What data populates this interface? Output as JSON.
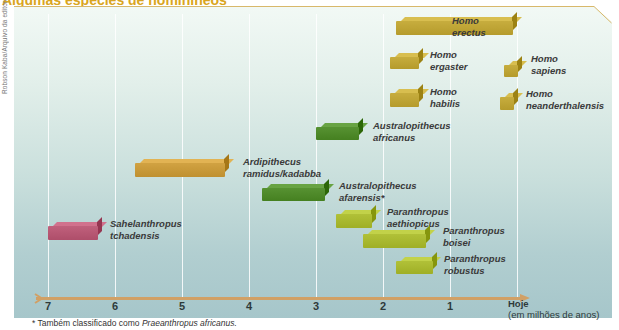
{
  "title": "Algumas espécies de hominíneos",
  "credit": "Robson Kaba/Arquivo da editora",
  "colors": {
    "homo": "#bfa536",
    "ardipithecus": "#c99a3a",
    "australopithecus": "#4f8a2a",
    "sahelanthropus": "#b85874",
    "paranthropus": "#a9b930",
    "axis": "#d1a065",
    "title": "#d9a520"
  },
  "axis": {
    "ticks": [
      "7",
      "6",
      "5",
      "4",
      "3",
      "2",
      "1"
    ],
    "end_label": "Hoje",
    "unit_label": "(em milhões de anos)"
  },
  "footnote": {
    "prefix": "* Também classificado como ",
    "italic": "Praeanthropus africanus."
  },
  "chart_data": {
    "type": "bar",
    "orientation": "horizontal-timeline",
    "title": "Algumas espécies de hominíneos",
    "xlabel": "Hoje (em milhões de anos)",
    "xlim": [
      7,
      0
    ],
    "x_ticks": [
      7,
      6,
      5,
      4,
      3,
      2,
      1,
      0
    ],
    "grid": true,
    "series": [
      {
        "name": "Homo erectus",
        "start_ma": 1.8,
        "end_ma": 0.0,
        "group": "Homo",
        "label_line1": "Homo",
        "label_line2": "erectus"
      },
      {
        "name": "Homo ergaster",
        "start_ma": 1.9,
        "end_ma": 1.4,
        "group": "Homo",
        "label_line1": "Homo",
        "label_line2": "ergaster"
      },
      {
        "name": "Homo sapiens",
        "start_ma": 0.2,
        "end_ma": 0.0,
        "group": "Homo",
        "label_line1": "Homo",
        "label_line2": "sapiens"
      },
      {
        "name": "Homo habilis",
        "start_ma": 1.9,
        "end_ma": 1.4,
        "group": "Homo",
        "label_line1": "Homo",
        "label_line2": "habilis"
      },
      {
        "name": "Homo neanderthalensis",
        "start_ma": 0.25,
        "end_ma": 0.03,
        "group": "Homo",
        "label_line1": "Homo",
        "label_line2": "neanderthalensis"
      },
      {
        "name": "Australopithecus africanus",
        "start_ma": 3.0,
        "end_ma": 2.3,
        "group": "Australopithecus",
        "label_line1": "Australopithecus",
        "label_line2": "africanus"
      },
      {
        "name": "Ardipithecus ramidus/kadabba",
        "start_ma": 5.7,
        "end_ma": 4.3,
        "group": "Ardipithecus",
        "label_line1": "Ardipithecus",
        "label_line2": "ramidus/kadabba"
      },
      {
        "name": "Australopithecus afarensis*",
        "start_ma": 3.8,
        "end_ma": 2.8,
        "group": "Australopithecus",
        "label_line1": "Australopithecus",
        "label_line2": "afarensis*"
      },
      {
        "name": "Sahelanthropus tchadensis",
        "start_ma": 7.0,
        "end_ma": 6.2,
        "group": "Sahelanthropus",
        "label_line1": "Sahelanthropus",
        "label_line2": "tchadensis"
      },
      {
        "name": "Paranthropus aethiopicus",
        "start_ma": 2.7,
        "end_ma": 2.1,
        "group": "Paranthropus",
        "label_line1": "Paranthropus",
        "label_line2": "aethiopicus"
      },
      {
        "name": "Paranthropus boisei",
        "start_ma": 2.3,
        "end_ma": 1.3,
        "group": "Paranthropus",
        "label_line1": "Paranthropus",
        "label_line2": "boisei"
      },
      {
        "name": "Paranthropus robustus",
        "start_ma": 1.8,
        "end_ma": 1.2,
        "group": "Paranthropus",
        "label_line1": "Paranthropus",
        "label_line2": "robustus"
      }
    ],
    "annotations": [
      "* Também classificado como Praeanthropus africanus."
    ]
  }
}
